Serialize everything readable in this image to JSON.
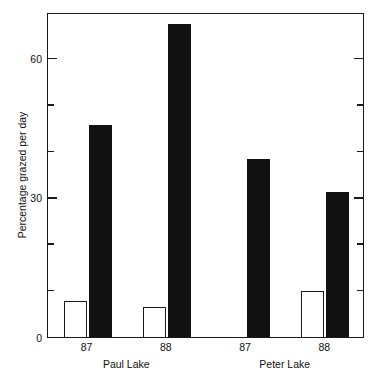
{
  "chart_data": {
    "type": "bar",
    "title": "",
    "subtitle": "",
    "xlabel": "",
    "ylabel": "Percentage grazed per day",
    "ylim": [
      0,
      70
    ],
    "yticks_major": [
      0,
      30,
      60
    ],
    "yticks_minor": [
      10,
      20,
      40,
      50
    ],
    "ytick_labels": [
      "0",
      "30",
      "60"
    ],
    "grid": false,
    "legend": "none",
    "categories": [
      "87",
      "88",
      "87",
      "88"
    ],
    "groups": [
      {
        "name": "Paul Lake",
        "categories": [
          "87",
          "88"
        ]
      },
      {
        "name": "Peter Lake",
        "categories": [
          "87",
          "88"
        ]
      }
    ],
    "series": [
      {
        "name": "open",
        "values": [
          7.8,
          6.5,
          0,
          10.0
        ]
      },
      {
        "name": "filled",
        "values": [
          45.6,
          67.5,
          38.3,
          31.3
        ]
      }
    ],
    "bars": [
      {
        "group": "Paul Lake",
        "category": "87",
        "style": "open",
        "value": 7.8
      },
      {
        "group": "Paul Lake",
        "category": "87",
        "style": "filled",
        "value": 45.6
      },
      {
        "group": "Paul Lake",
        "category": "88",
        "style": "open",
        "value": 6.5
      },
      {
        "group": "Paul Lake",
        "category": "88",
        "style": "filled",
        "value": 67.5
      },
      {
        "group": "Peter Lake",
        "category": "87",
        "style": "filled",
        "value": 38.3
      },
      {
        "group": "Peter Lake",
        "category": "88",
        "style": "open",
        "value": 10.0
      },
      {
        "group": "Peter Lake",
        "category": "88",
        "style": "filled",
        "value": 31.3
      }
    ],
    "colors": {
      "filled": "#111111",
      "open_fill": "#ffffff",
      "open_edge": "#1a1a1a",
      "axis": "#1a1a1a",
      "background": "#ffffff",
      "text": "#111111"
    }
  },
  "axes": {
    "y_title": "Percentage grazed per day",
    "y_labels": [
      "60",
      "30",
      "0"
    ],
    "x_tick_labels": [
      "87",
      "88",
      "87",
      "88"
    ],
    "group_labels": [
      "Paul Lake",
      "Peter Lake"
    ]
  }
}
